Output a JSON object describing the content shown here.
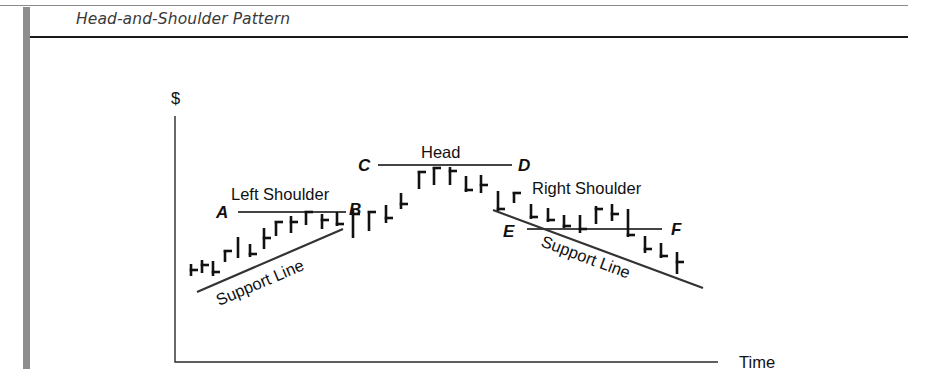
{
  "figure": {
    "title": "Head-and-Shoulder Pattern"
  },
  "chart_data": {
    "type": "ohlc-diagram",
    "title": "Head-and-Shoulder Pattern",
    "xlabel": "Time",
    "ylabel": "$",
    "grid": false,
    "annotations": {
      "head": "Head",
      "left_shoulder": "Left Shoulder",
      "right_shoulder": "Right Shoulder",
      "support_left": "Support Line",
      "support_right": "Support Line",
      "points": [
        "A",
        "B",
        "C",
        "D",
        "E",
        "F"
      ]
    },
    "levels": [
      {
        "label": "A-B",
        "from": "A",
        "to": "B",
        "y": 212,
        "x1": 238,
        "x2": 346
      },
      {
        "label": "C-D",
        "from": "C",
        "to": "D",
        "y": 165,
        "x1": 378,
        "x2": 512
      },
      {
        "label": "E-F",
        "from": "E",
        "to": "F",
        "y": 229,
        "x1": 527,
        "x2": 662
      }
    ],
    "support_lines": [
      {
        "label": "Support Line (left)",
        "x1": 197,
        "y1": 292,
        "x2": 343,
        "y2": 229
      },
      {
        "label": "Support Line (right)",
        "x1": 493,
        "y1": 210,
        "x2": 703,
        "y2": 288
      }
    ],
    "bars": [
      {
        "x": 191,
        "high": 264,
        "low": 276,
        "tick": "right",
        "tick_y": 270
      },
      {
        "x": 202,
        "high": 260,
        "low": 273,
        "tick": "right",
        "tick_y": 265
      },
      {
        "x": 213,
        "high": 261,
        "low": 276,
        "tick": "right",
        "tick_y": 272
      },
      {
        "x": 225,
        "high": 250,
        "low": 262,
        "tick": "right",
        "tick_y": 251
      },
      {
        "x": 238,
        "high": 237,
        "low": 258,
        "tick": "none",
        "tick_y": 0
      },
      {
        "x": 250,
        "high": 244,
        "low": 257,
        "tick": "right",
        "tick_y": 254
      },
      {
        "x": 264,
        "high": 228,
        "low": 249,
        "tick": "right",
        "tick_y": 238
      },
      {
        "x": 276,
        "high": 221,
        "low": 236,
        "tick": "right",
        "tick_y": 222
      },
      {
        "x": 291,
        "high": 216,
        "low": 233,
        "tick": "right",
        "tick_y": 222
      },
      {
        "x": 306,
        "high": 211,
        "low": 225,
        "tick": "right",
        "tick_y": 212
      },
      {
        "x": 322,
        "high": 214,
        "low": 229,
        "tick": "right",
        "tick_y": 220
      },
      {
        "x": 337,
        "high": 212,
        "low": 226,
        "tick": "right",
        "tick_y": 224
      },
      {
        "x": 353,
        "high": 210,
        "low": 238,
        "tick": "right",
        "tick_y": 214
      },
      {
        "x": 369,
        "high": 211,
        "low": 231,
        "tick": "right",
        "tick_y": 212
      },
      {
        "x": 386,
        "high": 205,
        "low": 223,
        "tick": "right",
        "tick_y": 218
      },
      {
        "x": 401,
        "high": 193,
        "low": 209,
        "tick": "right",
        "tick_y": 204
      },
      {
        "x": 419,
        "high": 171,
        "low": 189,
        "tick": "right",
        "tick_y": 172
      },
      {
        "x": 434,
        "high": 167,
        "low": 185,
        "tick": "right",
        "tick_y": 168
      },
      {
        "x": 450,
        "high": 167,
        "low": 185,
        "tick": "right",
        "tick_y": 171
      },
      {
        "x": 466,
        "high": 176,
        "low": 192,
        "tick": "right",
        "tick_y": 190
      },
      {
        "x": 481,
        "high": 175,
        "low": 193,
        "tick": "right",
        "tick_y": 185
      },
      {
        "x": 498,
        "high": 191,
        "low": 211,
        "tick": "right",
        "tick_y": 209
      },
      {
        "x": 514,
        "high": 192,
        "low": 203,
        "tick": "right",
        "tick_y": 193
      },
      {
        "x": 531,
        "high": 204,
        "low": 219,
        "tick": "right",
        "tick_y": 217
      },
      {
        "x": 548,
        "high": 208,
        "low": 222,
        "tick": "right",
        "tick_y": 220
      },
      {
        "x": 564,
        "high": 215,
        "low": 228,
        "tick": "right",
        "tick_y": 226
      },
      {
        "x": 580,
        "high": 215,
        "low": 233,
        "tick": "right",
        "tick_y": 229
      },
      {
        "x": 596,
        "high": 206,
        "low": 224,
        "tick": "right",
        "tick_y": 209
      },
      {
        "x": 612,
        "high": 204,
        "low": 221,
        "tick": "right",
        "tick_y": 214
      },
      {
        "x": 628,
        "high": 209,
        "low": 237,
        "tick": "right",
        "tick_y": 235
      },
      {
        "x": 645,
        "high": 236,
        "low": 253,
        "tick": "right",
        "tick_y": 249
      },
      {
        "x": 661,
        "high": 243,
        "low": 258,
        "tick": "right",
        "tick_y": 256
      },
      {
        "x": 677,
        "high": 252,
        "low": 274,
        "tick": "right",
        "tick_y": 262
      }
    ]
  }
}
